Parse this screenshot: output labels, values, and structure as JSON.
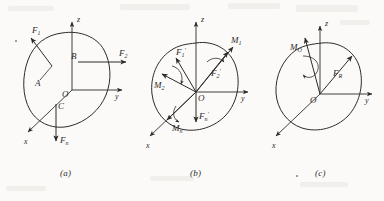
{
  "figure": {
    "title_caption_style": "italic-parenthetical",
    "panels": [
      {
        "id": "a",
        "caption": "(a)",
        "description": "Rigid body with original spatial force system acting at points A, B, C",
        "origin_label": "O",
        "axes": [
          {
            "name": "z",
            "label": "z",
            "direction": "up"
          },
          {
            "name": "y",
            "label": "y",
            "direction": "right"
          },
          {
            "name": "x",
            "label": "x",
            "direction": "lower-left"
          }
        ],
        "points": [
          {
            "label": "A",
            "note": "application point of F1"
          },
          {
            "label": "B",
            "note": "application point of F2"
          },
          {
            "label": "C",
            "note": "application point of Fn"
          }
        ],
        "forces": [
          {
            "label": "F",
            "sub": "1",
            "direction": "upper-left"
          },
          {
            "label": "F",
            "sub": "2",
            "direction": "right"
          },
          {
            "label": "F",
            "sub": "n",
            "direction": "down"
          }
        ],
        "moments": []
      },
      {
        "id": "b",
        "caption": "(b)",
        "description": "Forces translated to point O giving primed forces plus couple moments",
        "origin_label": "O",
        "axes": [
          {
            "name": "z",
            "label": "z",
            "direction": "up"
          },
          {
            "name": "y",
            "label": "y",
            "direction": "right"
          },
          {
            "name": "x",
            "label": "x",
            "direction": "lower-left"
          }
        ],
        "points": [],
        "forces": [
          {
            "label": "F",
            "sub": "1",
            "prime": "'",
            "direction": "upper-left"
          },
          {
            "label": "F",
            "sub": "2",
            "prime": "'",
            "direction": "upper-right"
          },
          {
            "label": "F",
            "sub": "n",
            "prime": "'",
            "direction": "down"
          }
        ],
        "moments": [
          {
            "label": "M",
            "sub": "1",
            "direction": "upper-right"
          },
          {
            "label": "M",
            "sub": "2",
            "direction": "left"
          },
          {
            "label": "M",
            "sub": "n",
            "direction": "lower-left"
          }
        ]
      },
      {
        "id": "c",
        "caption": "(c)",
        "description": "Resultant force F_R and resultant couple moment M_O at point O",
        "origin_label": "O",
        "axes": [
          {
            "name": "z",
            "label": "z",
            "direction": "up"
          },
          {
            "name": "y",
            "label": "y",
            "direction": "right"
          },
          {
            "name": "x",
            "label": "x",
            "direction": "lower-left"
          }
        ],
        "points": [],
        "forces": [
          {
            "label": "F",
            "sub": "R",
            "direction": "upper-right"
          }
        ],
        "moments": [
          {
            "label": "M",
            "sub": "O",
            "direction": "upper-left"
          }
        ]
      }
    ],
    "colors": {
      "ink": "#2b2b2b",
      "background": "#fbfaf8",
      "artifact": "#e9e6e0"
    }
  }
}
